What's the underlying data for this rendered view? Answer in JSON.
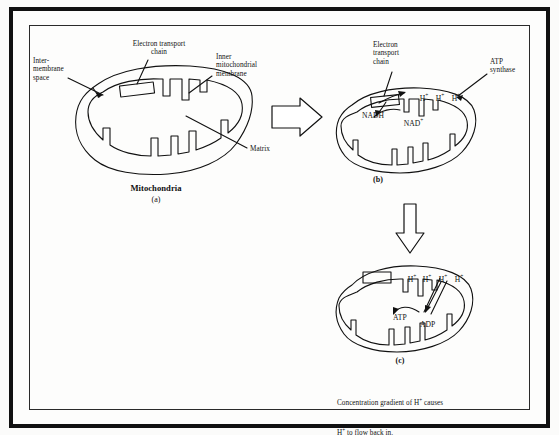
{
  "figure": {
    "title_a": "Mitochondria",
    "panel_labels": {
      "a": "(a)",
      "b": "(b)",
      "c": "(c)"
    },
    "caption": {
      "line1_pre": "Concentration gradient of H",
      "line1_sup": "+",
      "line1_post": " causes",
      "line2_pre": "H",
      "line2_sup": "+",
      "line2_post": " to flow back in."
    }
  },
  "panel_a": {
    "labels": {
      "intermembrane": "Inter-\nmembrane\nspace",
      "etc": "Electron transport\nchain",
      "inner_membrane": "Inner\nmitochondrial\nmembrane",
      "matrix": "Matrix"
    }
  },
  "panel_b": {
    "labels": {
      "etc": "Electron\ntransport\nchain",
      "atp_synthase": "ATP\nsynthase",
      "nadh": "NADH",
      "nad_plus_base": "NAD",
      "nad_plus_sup": "+"
    },
    "protons": [
      {
        "base": "H",
        "sup": "+"
      },
      {
        "base": "H",
        "sup": "+"
      },
      {
        "base": "H",
        "sup": "+"
      }
    ]
  },
  "panel_c": {
    "labels": {
      "atp": "ATP",
      "adp": "ADP"
    },
    "protons": [
      {
        "base": "H",
        "sup": "+"
      },
      {
        "base": "H",
        "sup": "+"
      },
      {
        "base": "H",
        "sup": "+"
      },
      {
        "base": "H",
        "sup": "+"
      }
    ]
  },
  "arrows": {
    "a_to_b": "block-arrow-right",
    "b_to_c": "block-arrow-down"
  },
  "colors": {
    "ink": "#111111",
    "frame": "#111111",
    "page": "#fdfdfc"
  }
}
